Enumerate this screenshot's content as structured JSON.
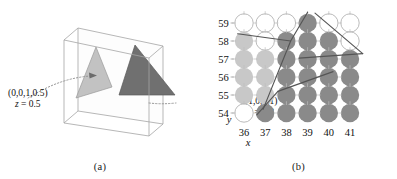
{
  "figure": {
    "captions": {
      "a": "(a)",
      "b": "(b)"
    }
  },
  "panel_a": {
    "name": "3d-slab-with-two-triangles",
    "box": {
      "stroke": "#9a9a9a"
    },
    "triangles": [
      {
        "id": "light-triangle",
        "fill": "#b9b9b9",
        "stroke": "#8d8d8d",
        "color_code": "(0,0,1,0.5)",
        "z": "z = 0.5"
      },
      {
        "id": "dark-triangle",
        "fill": "#6e6e6e",
        "stroke": "#555555",
        "color_code": "(1,0,0,1)",
        "z": "z = 0.8"
      }
    ],
    "label_left": {
      "line1": "(0,0,1,0.5)",
      "line2_prefix": "z",
      "line2_rest": " = 0.5"
    },
    "label_right": {
      "line1": "(1,0,0,1)",
      "line2_prefix": "z",
      "line2_rest": " = 0.8"
    }
  },
  "panel_b": {
    "name": "pixel-grid-with-triangle-edges",
    "axis": {
      "x_label": "x",
      "y_label": "y",
      "x_ticks": [
        "36",
        "37",
        "38",
        "39",
        "40",
        "41"
      ],
      "y_ticks": [
        "59",
        "58",
        "57",
        "56",
        "55",
        "54"
      ]
    },
    "legend_colors": {
      "empty": "#ffffff",
      "light": "#c8c8c8",
      "dark": "#8a8a8a",
      "outline": "#a8a8a8",
      "edge_line": "#555555"
    },
    "grid": {
      "columns": [
        36,
        37,
        38,
        39,
        40,
        41
      ],
      "rows": [
        59,
        58,
        57,
        56,
        55,
        54
      ],
      "cells": [
        [
          "empty",
          "empty",
          "empty",
          "dark",
          "empty",
          "empty"
        ],
        [
          "light",
          "empty",
          "dark",
          "dark",
          "dark",
          "empty"
        ],
        [
          "light",
          "light",
          "dark",
          "dark",
          "dark",
          "dark"
        ],
        [
          "light",
          "light",
          "dark",
          "dark",
          "dark",
          "dark"
        ],
        [
          "light",
          "light",
          "dark",
          "dark",
          "dark",
          "dark"
        ],
        [
          "empty",
          "dark",
          "dark",
          "dark",
          "dark",
          "dark"
        ]
      ]
    },
    "edges": [
      {
        "id": "edge-upper-right",
        "points": "39.0,59.6 38.2,58.0 36.9,54.2"
      },
      {
        "id": "edge-left-diagonal",
        "points": "35.7,58.4 38.2,58.0"
      },
      {
        "id": "edge-dark-hypotenuse",
        "points": "39.35,59.55 41.6,57.3"
      },
      {
        "id": "edge-dark-lower",
        "points": "41.6,57.3 38.6,57.05"
      },
      {
        "id": "edge-light-mid",
        "points": "40.2,56.3 37.6,55.2"
      },
      {
        "id": "edge-light-tail",
        "points": "37.6,55.2 36.6,53.9"
      }
    ]
  }
}
